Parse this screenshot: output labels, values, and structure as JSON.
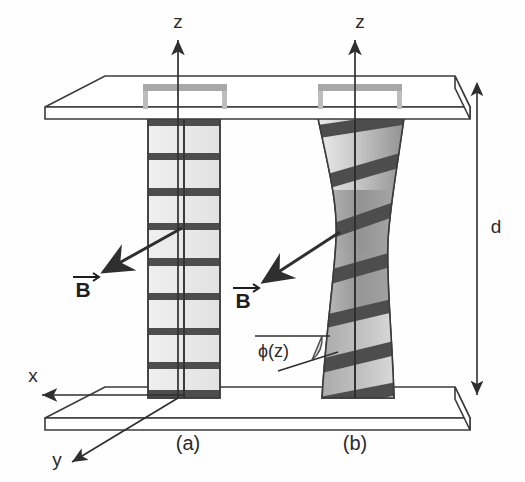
{
  "figure": {
    "background_color": "#fefefe",
    "line_color": "#3b3b3b",
    "band_color": "#4a4a4a",
    "plate_fill": "#ffffff",
    "ribbon_light": "#ececec",
    "ribbon_dark": "#8f8f8f",
    "bracket_color": "#a8a8a8"
  },
  "axes": {
    "z_left": {
      "label": "z",
      "x": 178,
      "y": 28
    },
    "z_right": {
      "label": "z",
      "x": 355,
      "y": 28
    },
    "x_axis": {
      "label": "x",
      "x": 33,
      "y": 382
    },
    "y_axis": {
      "label": "y",
      "x": 57,
      "y": 462
    }
  },
  "dimension": {
    "label": "d",
    "description": "plate separation",
    "x": 493,
    "y": 225
  },
  "panels": [
    {
      "id": "a",
      "label": "(a)",
      "x": 188,
      "y": 443,
      "type": "untwisted",
      "bands": 9
    },
    {
      "id": "b",
      "label": "(b)",
      "x": 355,
      "y": 443,
      "type": "twisted",
      "bands": 8
    }
  ],
  "field_vectors": [
    {
      "label": "B",
      "arrow": "→",
      "x": 83,
      "y": 290,
      "direction": "down-left"
    },
    {
      "label": "B",
      "arrow": "→",
      "x": 243,
      "y": 300,
      "direction": "down-left"
    }
  ],
  "angle_annotation": {
    "label": "ϕ(z)",
    "x": 258,
    "y": 356,
    "description": "twist angle as a function of z"
  },
  "plates": {
    "top": {
      "name": "top-plate"
    },
    "bottom": {
      "name": "bottom-plate"
    }
  }
}
